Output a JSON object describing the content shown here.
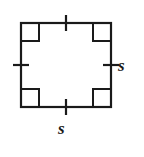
{
  "figure": {
    "type": "geometry-diagram",
    "shape": "square",
    "stroke_color": "#1a1a1a",
    "fill_color": "#ffffff",
    "background_color": "#ffffff",
    "stroke_width": 2.2,
    "square": {
      "left": 21,
      "top": 23,
      "right": 111,
      "bottom": 107,
      "width": 90,
      "height": 84
    },
    "corner_markers": [
      {
        "name": "top-left",
        "x": 21,
        "y": 23,
        "size": 18
      },
      {
        "name": "top-right",
        "x": 111,
        "y": 23,
        "size": 18
      },
      {
        "name": "bottom-left",
        "x": 21,
        "y": 107,
        "size": 18
      },
      {
        "name": "bottom-right",
        "x": 111,
        "y": 107,
        "size": 18
      }
    ],
    "tick_marks": [
      {
        "name": "top",
        "cx": 66,
        "cy": 23,
        "orientation": "vertical",
        "half_length": 8
      },
      {
        "name": "bottom",
        "cx": 66,
        "cy": 107,
        "orientation": "vertical",
        "half_length": 8
      },
      {
        "name": "left",
        "cx": 21,
        "cy": 65,
        "orientation": "horizontal",
        "half_length": 8
      },
      {
        "name": "right",
        "cx": 111,
        "cy": 65,
        "orientation": "horizontal",
        "half_length": 8
      }
    ],
    "labels": {
      "right": "s",
      "bottom": "s"
    }
  }
}
